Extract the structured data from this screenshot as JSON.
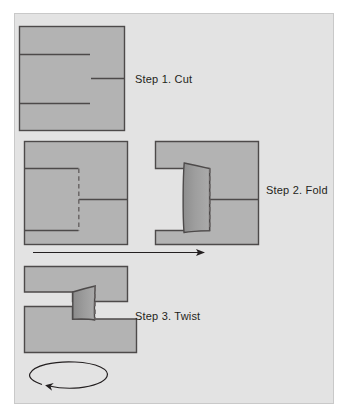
{
  "figure": {
    "panel": {
      "background_color": "#e3e3e3",
      "border_color": "#c9c9c9"
    },
    "colors": {
      "page_background": "#ffffff",
      "panel_background": "#e3e3e3",
      "sheet_fill": "#b3b3b3",
      "sheet_stroke": "#4d4a4a",
      "tab_fill_light": "#a3a3a3",
      "tab_fill_dark": "#8a8a8a",
      "cut_line": "#4d4a4a",
      "fold_line_dashed": "#6b6767",
      "arrow": "#231f20",
      "text": "#231f20"
    },
    "steps": [
      {
        "index": 1,
        "label": "Step 1. Cut",
        "label_x": 135,
        "label_y": 79,
        "description": "Square sheet with three straight cuts: two entering from the left edge and one entering from the right edge",
        "sheet": {
          "x": 19,
          "y": 26,
          "width": 105,
          "height": 104
        },
        "cuts": [
          {
            "name": "upper-cut-from-left",
            "x1": 19,
            "y1": 54,
            "x2": 90,
            "y2": 54
          },
          {
            "name": "middle-cut-from-right",
            "x1": 91,
            "y1": 78,
            "x2": 124,
            "y2": 78
          },
          {
            "name": "lower-cut-from-left",
            "x1": 19,
            "y1": 103,
            "x2": 90,
            "y2": 103
          }
        ]
      },
      {
        "index": 2,
        "label": "Step 2. Fold",
        "label_x": 266,
        "label_y": 190,
        "description": "Left square shows the cut tab outlined with a dashed fold line; right square shows the tab folded up out of the plane as a shaded trapezoid",
        "before_sheet": {
          "x": 24,
          "y": 141,
          "width": 103,
          "height": 103
        },
        "after_sheet": {
          "x": 155,
          "y": 141,
          "width": 103,
          "height": 103
        },
        "fold_line_style": "dashed",
        "tab_shape": "trapezoid-curved"
      },
      {
        "index": 3,
        "label": "Step 3. Twist",
        "label_x": 135,
        "label_y": 316,
        "description": "The lower half of the sheet is rotated about a vertical axis so the bottom band shifts to the right; the folded tab remains standing and a curved arrow beneath shows the twist direction",
        "upper_band": {
          "x": 24,
          "y": 266,
          "width": 103,
          "height": 36
        },
        "lower_band": {
          "x": 24,
          "y": 306,
          "width": 112,
          "height": 46
        },
        "rotation_arrow": {
          "name": "twist-rotation-arrow",
          "center_x": 71,
          "center_y": 373,
          "radius_x": 38,
          "radius_y": 13,
          "direction": "counterclockwise-open-ellipse"
        }
      }
    ],
    "transition_arrow": {
      "name": "step2-to-step3-arrow",
      "x1": 33,
      "y1": 252,
      "x2": 205,
      "y2": 252,
      "direction": "right"
    }
  }
}
